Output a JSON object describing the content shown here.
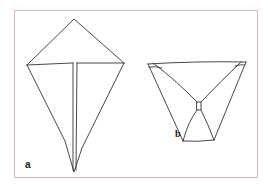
{
  "figure": {
    "panels": [
      {
        "id": "a",
        "label": "a",
        "description": "Kite-shaped fold with horizontal crease and vertical center fold"
      },
      {
        "id": "b",
        "label": "b",
        "description": "Trapezoid fold with crossing diagonal creases meeting at a small square"
      }
    ],
    "colors": {
      "frame_border": "#d9b8b8",
      "line": "#333333",
      "background": "#ffffff"
    }
  }
}
